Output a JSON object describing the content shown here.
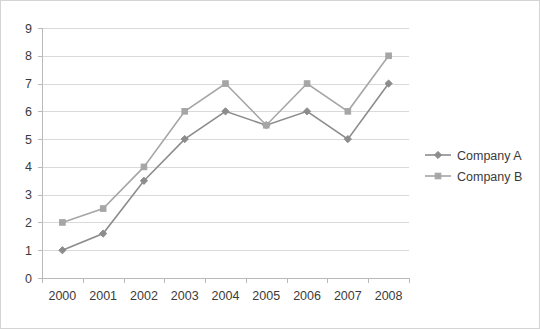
{
  "chart_data": {
    "type": "line",
    "title": "",
    "subtitle": "",
    "xlabel": "",
    "ylabel": "",
    "categories": [
      "2000",
      "2001",
      "2002",
      "2003",
      "2004",
      "2005",
      "2006",
      "2007",
      "2008"
    ],
    "series": [
      {
        "name": "Company A",
        "marker": "diamond",
        "color": "#8c8c8c",
        "values": [
          1,
          1.6,
          3.5,
          5,
          6,
          5.5,
          6,
          5,
          7
        ]
      },
      {
        "name": "Company B",
        "marker": "square",
        "color": "#a6a6a6",
        "values": [
          2,
          2.5,
          4,
          6,
          7,
          5.5,
          7,
          6,
          8
        ]
      }
    ],
    "ylim": [
      0,
      9
    ],
    "y_ticks": [
      "0",
      "1",
      "2",
      "3",
      "4",
      "5",
      "6",
      "7",
      "8",
      "9"
    ],
    "grid": true,
    "legend_position": "right",
    "legend_entries": [
      "Company A",
      "Company B"
    ]
  },
  "colors": {
    "series_a": "#8c8c8c",
    "series_b": "#a6a6a6",
    "gridline": "#d9d9d9",
    "axis": "#b9b9b9",
    "border": "#d4d4d4",
    "text": "#3b3b3b",
    "background": "#ffffff"
  }
}
